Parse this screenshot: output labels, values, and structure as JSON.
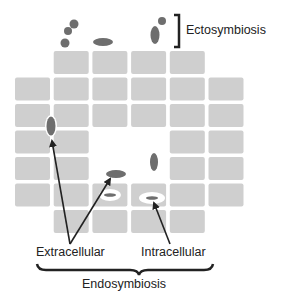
{
  "labels": {
    "ectosymbiosis": "Ectosymbiosis",
    "extracellular": "Extracellular",
    "intracellular": "Intracellular",
    "endosymbiosis": "Endosymbiosis"
  },
  "colors": {
    "cell_fill": "#cfcfcf",
    "microbe_fill": "#6e6e6e",
    "arrow": "#222222",
    "bracket": "#222222",
    "vacuole": "#ffffff"
  },
  "grid": {
    "rows": [
      [
        0,
        1,
        1,
        1,
        1,
        0
      ],
      [
        1,
        1,
        1,
        1,
        1,
        1
      ],
      [
        1,
        1,
        1,
        1,
        1,
        1
      ],
      [
        1,
        1,
        0,
        0,
        1,
        1
      ],
      [
        1,
        1,
        0,
        0,
        1,
        1
      ],
      [
        1,
        1,
        1,
        1,
        1,
        1
      ],
      [
        0,
        1,
        1,
        1,
        1,
        0
      ]
    ]
  }
}
